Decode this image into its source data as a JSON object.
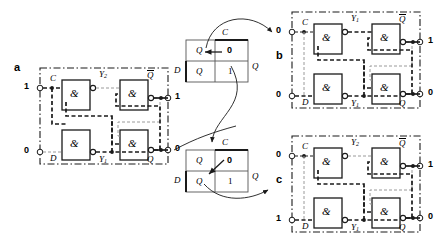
{
  "figure": {
    "type": "digital-logic-diagram"
  },
  "panels": [
    {
      "id": "a",
      "label": "a",
      "inputs": [
        {
          "name": "C",
          "value": "1"
        },
        {
          "name": "D",
          "value": "0"
        }
      ],
      "internal": [
        {
          "name": "Y",
          "sub": "2"
        },
        {
          "name": "Y",
          "sub": "1"
        }
      ],
      "outputs": [
        {
          "name": "Q",
          "overline": true,
          "value": "1"
        },
        {
          "name": "Q",
          "overline": false,
          "value": "0"
        }
      ],
      "gates": [
        {
          "symbol": "&"
        },
        {
          "symbol": "&"
        },
        {
          "symbol": "&"
        },
        {
          "symbol": "&"
        }
      ]
    },
    {
      "id": "b",
      "label": "b",
      "inputs": [
        {
          "name": "C",
          "value": "0"
        },
        {
          "name": "D",
          "value": "0"
        }
      ],
      "internal": [
        {
          "name": "Y",
          "sub": "1"
        },
        {
          "name": "Y",
          "sub": "1"
        }
      ],
      "outputs": [
        {
          "name": "Q",
          "overline": true,
          "value": "1"
        },
        {
          "name": "Q",
          "overline": false,
          "value": "0"
        }
      ],
      "gates": [
        {
          "symbol": "&"
        },
        {
          "symbol": "&"
        },
        {
          "symbol": "&"
        },
        {
          "symbol": "&"
        }
      ]
    },
    {
      "id": "c",
      "label": "c",
      "inputs": [
        {
          "name": "C",
          "value": "0"
        },
        {
          "name": "D",
          "value": "1"
        }
      ],
      "internal": [
        {
          "name": "Y",
          "sub": "2"
        },
        {
          "name": "Y",
          "sub": "1"
        }
      ],
      "outputs": [
        {
          "name": "Q",
          "overline": true,
          "value": "1"
        },
        {
          "name": "Q",
          "overline": false,
          "value": "0"
        }
      ],
      "gates": [
        {
          "symbol": "&"
        },
        {
          "symbol": "&"
        },
        {
          "symbol": "&"
        },
        {
          "symbol": "&"
        }
      ]
    }
  ],
  "tables": [
    {
      "id": "table-top",
      "col_header": "C",
      "row_header": "D",
      "side_label": "Q",
      "cells": [
        [
          "Q",
          "0"
        ],
        [
          "Q",
          "1"
        ]
      ]
    },
    {
      "id": "table-bottom",
      "col_header": "C",
      "row_header": "D",
      "side_label": "Q",
      "cells": [
        [
          "Q",
          "0"
        ],
        [
          "Q",
          "1"
        ]
      ]
    }
  ],
  "colors": {
    "line": "#1a1a1a",
    "faint": "#9a9a9a",
    "background": "#ffffff"
  }
}
